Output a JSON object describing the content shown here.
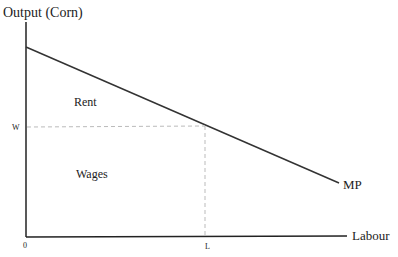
{
  "diagram": {
    "y_axis_label": "Output (Corn)",
    "x_axis_label": "Labour",
    "curve_label": "MP",
    "origin_label": "0",
    "wage_label": "W",
    "labour_label": "L",
    "regions": {
      "upper": "Rent",
      "lower": "Wages"
    },
    "colors": {
      "axis": "#222222",
      "curve": "#333333",
      "dashed": "#bbbbbb"
    }
  }
}
